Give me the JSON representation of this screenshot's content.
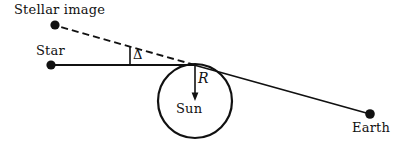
{
  "figure": {
    "background_color": "#ffffff",
    "stroke_color": "#111111",
    "width": 406,
    "height": 147
  },
  "labels": {
    "stellar_image": "Stellar image",
    "star": "Star",
    "earth": "Earth",
    "sun": "Sun",
    "radius": "R",
    "deflection_angle": "Δ"
  },
  "geometry": {
    "sun_center": {
      "x": 195,
      "y": 101
    },
    "sun_radius": 37,
    "tangent_point": {
      "x": 195,
      "y": 65
    },
    "star_point": {
      "x": 51,
      "y": 65
    },
    "stellar_image_point": {
      "x": 55,
      "y": 25
    },
    "earth_point": {
      "x": 370,
      "y": 114
    },
    "angle_tick": {
      "x": 130,
      "y": 48,
      "height": 17
    },
    "dot_radius": 4.5,
    "dash_pattern": "7,4"
  }
}
